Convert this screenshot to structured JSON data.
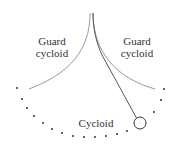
{
  "diagram": {
    "type": "cycloidal-pendulum",
    "labels": {
      "left_guard_line1": "Guard",
      "left_guard_line2": "cycloid",
      "right_guard_line1": "Guard",
      "right_guard_line2": "cycloid",
      "bottom": "Cycloid"
    },
    "colors": {
      "background": "#ffffff",
      "guard_curve": "#9a9a9a",
      "string": "#555555",
      "dots": "#333333",
      "bob": "#333333",
      "text": "#333333"
    },
    "elements": {
      "guard_cycloid_left": "curve from cusp (90,13) down-left to (29,89)",
      "guard_cycloid_right": "curve from cusp (93,13) down-right to (155,89)",
      "pendulum_string": "wraps right guard from cusp then straight to bob",
      "bob": {
        "cx": 140,
        "cy": 123,
        "r": 6
      },
      "cycloid_dots": [
        [
          17,
          88
        ],
        [
          22,
          99
        ],
        [
          27,
          108
        ],
        [
          34,
          116
        ],
        [
          43,
          123
        ],
        [
          52,
          129
        ],
        [
          62,
          133
        ],
        [
          73,
          136
        ],
        [
          84,
          137
        ],
        [
          95,
          137
        ],
        [
          106,
          136
        ],
        [
          117,
          134
        ],
        [
          127,
          131
        ],
        [
          154,
          112
        ],
        [
          161,
          100
        ],
        [
          164,
          89
        ]
      ]
    }
  }
}
